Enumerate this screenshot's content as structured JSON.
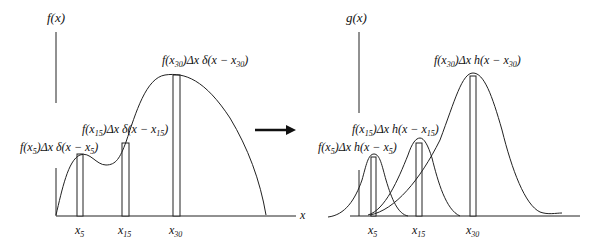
{
  "left_panel": {
    "y_axis_label": "f(x)",
    "x_axis_label": "x",
    "annotations": [
      {
        "id": "x5",
        "prefix": "f(x",
        "sub": "5",
        "mid": ")Δx δ(x − x",
        "sub2": "5",
        "suffix": ")"
      },
      {
        "id": "x15",
        "prefix": "f(x",
        "sub": "15",
        "mid": ")Δx δ(x − x",
        "sub2": "15",
        "suffix": ")"
      },
      {
        "id": "x30",
        "prefix": "f(x",
        "sub": "30",
        "mid": ")Δx δ(x − x",
        "sub2": "30",
        "suffix": ")"
      }
    ],
    "ticks": [
      {
        "base": "x",
        "sub": "5"
      },
      {
        "base": "x",
        "sub": "15"
      },
      {
        "base": "x",
        "sub": "30"
      }
    ]
  },
  "arrow": {
    "direction": "right"
  },
  "right_panel": {
    "y_axis_label": "g(x)",
    "annotations": [
      {
        "id": "x5",
        "prefix": "f(x",
        "sub": "5",
        "mid": ")Δx h(x − x",
        "sub2": "5",
        "suffix": ")"
      },
      {
        "id": "x15",
        "prefix": "f(x",
        "sub": "15",
        "mid": ")Δx h(x − x",
        "sub2": "15",
        "suffix": ")"
      },
      {
        "id": "x30",
        "prefix": "f(x",
        "sub": "30",
        "mid": ")Δx h(x − x",
        "sub2": "30",
        "suffix": ")"
      }
    ],
    "ticks": [
      {
        "base": "x",
        "sub": "5"
      },
      {
        "base": "x",
        "sub": "15"
      },
      {
        "base": "x",
        "sub": "30"
      }
    ]
  },
  "colors": {
    "line": "#222222",
    "background": "#ffffff"
  }
}
